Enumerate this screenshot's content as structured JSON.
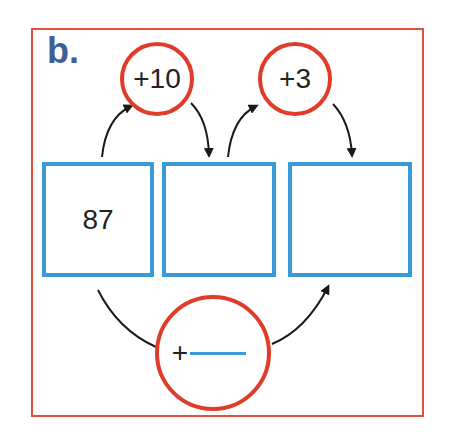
{
  "exercise": {
    "label": "b.",
    "top_operators": [
      {
        "text": "+10"
      },
      {
        "text": "+3"
      }
    ],
    "boxes": [
      {
        "value": "87"
      },
      {
        "value": ""
      },
      {
        "value": ""
      }
    ],
    "bottom_operator": {
      "prefix": "+",
      "blank": ""
    },
    "colors": {
      "frame": "#e0503a",
      "circle": "#e03c2c",
      "box": "#3d9ad8",
      "label": "#3f5f9a",
      "arrow": "#1a1a1a"
    }
  }
}
